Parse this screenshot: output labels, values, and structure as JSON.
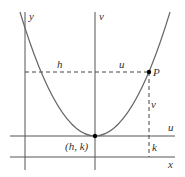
{
  "figure": {
    "axes": {
      "y": {
        "label": "y"
      },
      "v": {
        "label": "v"
      },
      "u": {
        "label": "u"
      },
      "x": {
        "label": "x"
      }
    },
    "point_P": {
      "label": "P"
    },
    "vertex": {
      "label": "(h, k)"
    },
    "distances": {
      "h": "h",
      "u": "u",
      "v": "v",
      "k": "k"
    },
    "colors": {
      "axis": "#555555",
      "curve": "#666666",
      "dash": "#444444",
      "point": "#000000"
    }
  }
}
